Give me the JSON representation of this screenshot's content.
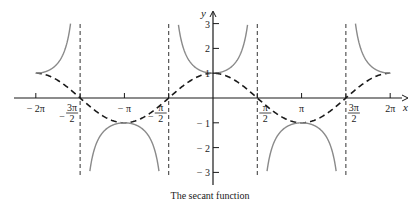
{
  "chart_data": {
    "type": "line",
    "title": "The secant function",
    "xlabel": "x",
    "ylabel": "y",
    "xlim": [
      -6.2832,
      6.2832
    ],
    "ylim": [
      -3,
      3
    ],
    "grid": false,
    "legend": "none",
    "x_ticks": [
      {
        "value": -6.2832,
        "label": "− 2π",
        "num": "",
        "den": "",
        "prefix": ""
      },
      {
        "value": -4.7124,
        "label": "− 3π/2",
        "num": "3π",
        "den": "2",
        "prefix": "−"
      },
      {
        "value": -3.1416,
        "label": "− π",
        "num": "",
        "den": "",
        "prefix": ""
      },
      {
        "value": -1.5708,
        "label": "− π/2",
        "num": "π",
        "den": "2",
        "prefix": "−"
      },
      {
        "value": 1.5708,
        "label": "π/2",
        "num": "π",
        "den": "2",
        "prefix": ""
      },
      {
        "value": 3.1416,
        "label": "π",
        "num": "",
        "den": "",
        "prefix": ""
      },
      {
        "value": 4.7124,
        "label": "3π/2",
        "num": "3π",
        "den": "2",
        "prefix": ""
      },
      {
        "value": 6.2832,
        "label": "2π",
        "num": "",
        "den": "",
        "prefix": ""
      }
    ],
    "y_ticks": [
      {
        "value": 3,
        "label": "3"
      },
      {
        "value": 2,
        "label": "2"
      },
      {
        "value": 1,
        "label": "1"
      },
      {
        "value": -1,
        "label": "− 1"
      },
      {
        "value": -2,
        "label": "− 2"
      },
      {
        "value": -3,
        "label": "− 3"
      }
    ],
    "series": [
      {
        "name": "sec x",
        "function": "1/cos(x)",
        "style": "solid",
        "color": "#8a8a8a",
        "domain": [
          -6.2832,
          6.2832
        ]
      },
      {
        "name": "cos x",
        "function": "cos(x)",
        "style": "dashed",
        "color": "#1a1a1a",
        "domain": [
          -6.2832,
          6.2832
        ]
      }
    ],
    "asymptotes": [
      -4.7124,
      -1.5708,
      1.5708,
      4.7124
    ],
    "asymptote_style": "dashed"
  }
}
